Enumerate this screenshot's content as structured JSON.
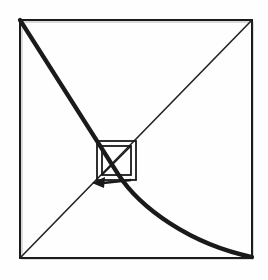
{
  "figure": {
    "caption": "",
    "background_color": "#fefefe",
    "ink_color": "#1a1a1a",
    "frame": {
      "name": "outer-square-frame",
      "x": 20,
      "y": 20,
      "width": 232,
      "height": 238,
      "stroke_width": 2.2,
      "corners": {
        "top_left": [
          20,
          20
        ],
        "top_right": [
          252,
          20
        ],
        "bottom_right": [
          252,
          258
        ],
        "bottom_left": [
          20,
          258
        ]
      }
    },
    "thin_diagonal": {
      "name": "ascending-diagonal-line",
      "from": [
        20,
        258
      ],
      "to": [
        252,
        20
      ],
      "stroke_width": 1.6,
      "description": "straight line from bottom-left corner to top-right corner"
    },
    "thick_curve": {
      "name": "decaying-spiral-curve",
      "from": [
        20,
        20
      ],
      "through": [
        116,
        172
      ],
      "to": [
        252,
        258
      ],
      "stroke_width": 4.2,
      "description": "heavy curve from top-left corner bending through the centre then flattening toward the bottom-right corner"
    },
    "nested_squares": [
      {
        "name": "central-square-outer",
        "x": 97,
        "y": 141,
        "size": 39,
        "stroke_width": 1.8
      },
      {
        "name": "central-square-inner",
        "x": 102,
        "y": 146,
        "size": 29,
        "stroke_width": 1.8
      }
    ],
    "central_diagonals": [
      {
        "name": "central-diagonal-nw-se",
        "from": [
          102,
          146
        ],
        "to": [
          131,
          175
        ],
        "stroke_width": 1.5
      },
      {
        "name": "central-diagonal-ne-sw",
        "from": [
          131,
          146
        ],
        "to": [
          102,
          175
        ],
        "stroke_width": 1.5
      }
    ],
    "arrow": {
      "name": "leftward-direction-arrow",
      "tail": [
        131,
        180
      ],
      "head": [
        92,
        183
      ],
      "stroke_width": 2.4,
      "head_length": 13,
      "head_half_width": 5,
      "direction": "left",
      "description": "solid arrowhead on the lower edge of the central squares pointing to the left"
    }
  }
}
